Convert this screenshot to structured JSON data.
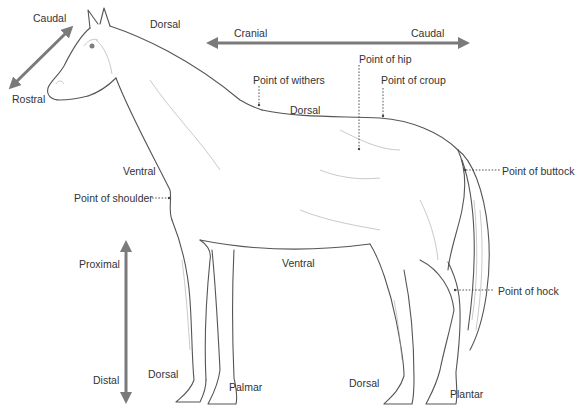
{
  "diagram": {
    "colors": {
      "arrow": "#7a7a7a",
      "text": "#333333",
      "leader": "#444444",
      "sketch": "#555555",
      "shade": "#9a9a9a"
    },
    "arrows": {
      "head": {
        "start_label": "Caudal",
        "end_label": "Rostral"
      },
      "body": {
        "start_label": "Cranial",
        "end_label": "Caudal"
      },
      "limb": {
        "start_label": "Proximal",
        "end_label": "Distal"
      }
    },
    "labels": {
      "caudal_head": "Caudal",
      "rostral": "Rostral",
      "dorsal_neck": "Dorsal",
      "cranial": "Cranial",
      "caudal_body": "Caudal",
      "point_of_hip": "Point of hip",
      "point_of_withers": "Point of withers",
      "point_of_croup": "Point of croup",
      "dorsal_back": "Dorsal",
      "ventral_neck": "Ventral",
      "point_of_shoulder": "Point of shoulder",
      "point_of_buttock": "Point of buttock",
      "proximal": "Proximal",
      "ventral_belly": "Ventral",
      "point_of_hock": "Point of hock",
      "distal": "Distal",
      "dorsal_foreleg": "Dorsal",
      "palmar": "Palmar",
      "dorsal_hindleg": "Dorsal",
      "plantar": "Plantar"
    }
  }
}
